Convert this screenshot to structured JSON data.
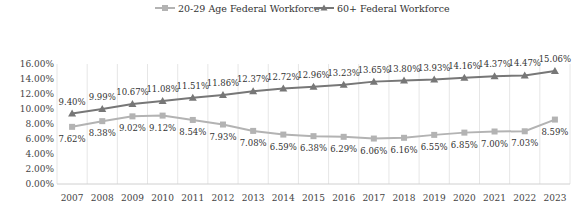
{
  "chart_data": {
    "type": "line",
    "title": "",
    "xlabel": "",
    "ylabel": "",
    "categories": [
      "2007",
      "2008",
      "2009",
      "2010",
      "2011",
      "2012",
      "2013",
      "2014",
      "2015",
      "2016",
      "2017",
      "2018",
      "2019",
      "2020",
      "2021",
      "2022",
      "2023"
    ],
    "ylim": [
      0,
      16
    ],
    "yticks": [
      0,
      2,
      4,
      6,
      8,
      10,
      12,
      14,
      16
    ],
    "ytick_labels": [
      "0.00%",
      "2.00%",
      "4.00%",
      "6.00%",
      "8.00%",
      "10.00%",
      "12.00%",
      "14.00%",
      "16.00%"
    ],
    "grid": "vertical",
    "legend_position": "top-center",
    "series": [
      {
        "name": "20-29 Age Federal Workforce",
        "marker": "square",
        "color": "#b3b3b3",
        "label_position": "below",
        "values": [
          7.62,
          8.38,
          9.02,
          9.12,
          8.54,
          7.93,
          7.08,
          6.59,
          6.38,
          6.29,
          6.06,
          6.16,
          6.55,
          6.85,
          7.0,
          7.03,
          8.59
        ],
        "labels": [
          "7.62%",
          "8.38%",
          "9.02%",
          "9.12%",
          "8.54%",
          "7.93%",
          "7.08%",
          "6.59%",
          "6.38%",
          "6.29%",
          "6.06%",
          "6.16%",
          "6.55%",
          "6.85%",
          "7.00%",
          "7.03%",
          "8.59%"
        ]
      },
      {
        "name": "60+ Federal Workforce",
        "marker": "triangle",
        "color": "#777777",
        "label_position": "above",
        "values": [
          9.4,
          9.99,
          10.67,
          11.08,
          11.51,
          11.86,
          12.37,
          12.72,
          12.96,
          13.23,
          13.65,
          13.8,
          13.93,
          14.16,
          14.37,
          14.47,
          15.06
        ],
        "labels": [
          "9.40%",
          "9.99%",
          "10.67%",
          "11.08%",
          "11.51%",
          "11.86%",
          "12.37%",
          "12.72%",
          "12.96%",
          "13.23%",
          "13.65%",
          "13.80%",
          "13.93%",
          "14.16%",
          "14.37%",
          "14.47%",
          "15.06%"
        ]
      }
    ]
  }
}
